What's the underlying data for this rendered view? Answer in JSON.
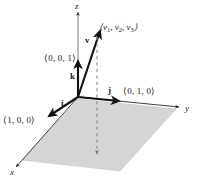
{
  "figure": {
    "type": "3d-vector-diagram",
    "background_color": "#ffffff",
    "plane_fill_color": "#d5d5d5",
    "line_color": "#1a1a1a",
    "axes": [
      {
        "name": "x",
        "label": "x",
        "x": 10,
        "y": 172
      },
      {
        "name": "y",
        "label": "y",
        "x": 185,
        "y": 108
      },
      {
        "name": "z",
        "label": "z",
        "x": 75,
        "y": 3
      }
    ],
    "vectors": [
      {
        "name": "i",
        "label": "i",
        "label_x": 61,
        "label_y": 102,
        "components_label": "⟨1, 0, 0⟩",
        "components_x": 3,
        "components_y": 119
      },
      {
        "name": "j",
        "label": "j",
        "label_x": 108,
        "label_y": 89,
        "components_label": "⟨0, 1, 0⟩",
        "components_x": 123,
        "components_y": 90
      },
      {
        "name": "k",
        "label": "k",
        "label_x": 70,
        "label_y": 75,
        "components_label": "⟨0, 0, 1⟩",
        "components_x": 44,
        "components_y": 57
      },
      {
        "name": "v",
        "label": "v",
        "label_x": 85,
        "label_y": 38,
        "components_prefix": "⟨",
        "components_x": 99,
        "components_y": 25,
        "components_parts": [
          {
            "sym": "v",
            "sub": "1",
            "sep": ", "
          },
          {
            "sym": "v",
            "sub": "2",
            "sep": ", "
          },
          {
            "sym": "v",
            "sub": "3",
            "sep": ""
          }
        ],
        "components_suffix": "⟩"
      }
    ],
    "origin": {
      "x": 78,
      "y": 97
    },
    "projection_line": {
      "style": "dashed",
      "from_x": 97,
      "from_y": 36,
      "to_x": 97,
      "to_y": 156
    }
  }
}
